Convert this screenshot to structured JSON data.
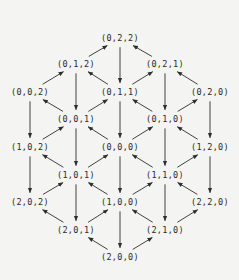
{
  "diagram": {
    "type": "directed-lattice",
    "colors": {
      "background": "#f4f4f2",
      "ink": "#2a2a2a"
    },
    "nodes": [
      {
        "id": "022",
        "label": "(0,2,2)",
        "x": 120,
        "y": 38
      },
      {
        "id": "012",
        "label": "(0,1,2)",
        "x": 76,
        "y": 64
      },
      {
        "id": "021",
        "label": "(0,2,1)",
        "x": 165,
        "y": 64
      },
      {
        "id": "002",
        "label": "(0,0,2)",
        "x": 30,
        "y": 92
      },
      {
        "id": "011",
        "label": "(0,1,1)",
        "x": 120,
        "y": 92
      },
      {
        "id": "020",
        "label": "(0,2,0)",
        "x": 210,
        "y": 92
      },
      {
        "id": "001",
        "label": "(0,0,1)",
        "x": 76,
        "y": 119
      },
      {
        "id": "010",
        "label": "(0,1,0)",
        "x": 165,
        "y": 119
      },
      {
        "id": "102",
        "label": "(1,0,2)",
        "x": 30,
        "y": 147
      },
      {
        "id": "000",
        "label": "(0,0,0)",
        "x": 120,
        "y": 147
      },
      {
        "id": "120",
        "label": "(1,2,0)",
        "x": 210,
        "y": 147
      },
      {
        "id": "101",
        "label": "(1,0,1)",
        "x": 76,
        "y": 175
      },
      {
        "id": "110",
        "label": "(1,1,0)",
        "x": 165,
        "y": 175
      },
      {
        "id": "202",
        "label": "(2,0,2)",
        "x": 30,
        "y": 202
      },
      {
        "id": "100",
        "label": "(1,0,0)",
        "x": 120,
        "y": 202
      },
      {
        "id": "220",
        "label": "(2,2,0)",
        "x": 210,
        "y": 202
      },
      {
        "id": "201",
        "label": "(2,0,1)",
        "x": 76,
        "y": 230
      },
      {
        "id": "210",
        "label": "(2,1,0)",
        "x": 165,
        "y": 230
      },
      {
        "id": "200",
        "label": "(2,0,0)",
        "x": 120,
        "y": 257
      }
    ],
    "edges": [
      {
        "from": "022",
        "to": "011"
      },
      {
        "from": "012",
        "to": "022"
      },
      {
        "from": "021",
        "to": "022"
      },
      {
        "from": "012",
        "to": "001"
      },
      {
        "from": "021",
        "to": "010"
      },
      {
        "from": "002",
        "to": "012"
      },
      {
        "from": "011",
        "to": "012"
      },
      {
        "from": "011",
        "to": "021"
      },
      {
        "from": "020",
        "to": "021"
      },
      {
        "from": "002",
        "to": "102"
      },
      {
        "from": "011",
        "to": "000"
      },
      {
        "from": "020",
        "to": "120"
      },
      {
        "from": "001",
        "to": "002"
      },
      {
        "from": "001",
        "to": "011"
      },
      {
        "from": "010",
        "to": "011"
      },
      {
        "from": "010",
        "to": "020"
      },
      {
        "from": "001",
        "to": "101"
      },
      {
        "from": "010",
        "to": "110"
      },
      {
        "from": "102",
        "to": "001"
      },
      {
        "from": "000",
        "to": "001"
      },
      {
        "from": "000",
        "to": "010"
      },
      {
        "from": "120",
        "to": "010"
      },
      {
        "from": "102",
        "to": "202"
      },
      {
        "from": "000",
        "to": "100"
      },
      {
        "from": "120",
        "to": "220"
      },
      {
        "from": "101",
        "to": "102"
      },
      {
        "from": "101",
        "to": "000"
      },
      {
        "from": "110",
        "to": "000"
      },
      {
        "from": "110",
        "to": "120"
      },
      {
        "from": "101",
        "to": "201"
      },
      {
        "from": "110",
        "to": "210"
      },
      {
        "from": "202",
        "to": "101"
      },
      {
        "from": "100",
        "to": "101"
      },
      {
        "from": "100",
        "to": "110"
      },
      {
        "from": "220",
        "to": "110"
      },
      {
        "from": "100",
        "to": "200"
      },
      {
        "from": "201",
        "to": "202"
      },
      {
        "from": "201",
        "to": "100"
      },
      {
        "from": "210",
        "to": "100"
      },
      {
        "from": "210",
        "to": "220"
      },
      {
        "from": "200",
        "to": "201"
      },
      {
        "from": "200",
        "to": "210"
      }
    ]
  }
}
